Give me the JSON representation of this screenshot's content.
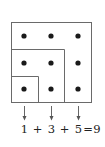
{
  "diagram": {
    "grid_size": 3,
    "colors": {
      "line": "#6a6a6a",
      "dot": "#1a1a1a",
      "arrow": "#555555",
      "text": "#222222"
    },
    "dots": [
      {
        "x": 24,
        "y": 36
      },
      {
        "x": 51,
        "y": 36
      },
      {
        "x": 78,
        "y": 36
      },
      {
        "x": 24,
        "y": 63
      },
      {
        "x": 51,
        "y": 63
      },
      {
        "x": 78,
        "y": 63
      },
      {
        "x": 24,
        "y": 89
      },
      {
        "x": 51,
        "y": 89
      },
      {
        "x": 78,
        "y": 89
      }
    ],
    "nested_squares": [
      {
        "size": 1,
        "dots": 1,
        "label": "1"
      },
      {
        "size": 2,
        "added_dots": 3,
        "label": "3"
      },
      {
        "size": 3,
        "added_dots": 5,
        "label": "5"
      }
    ],
    "equation": {
      "term1": "1",
      "op1": "+",
      "term2": "3",
      "op2": "+",
      "term3": "5",
      "equals": "=",
      "result": "9"
    }
  }
}
